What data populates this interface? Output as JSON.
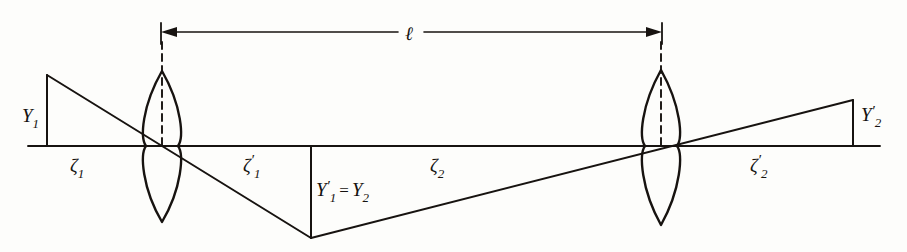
{
  "figure": {
    "background_color": "#fdfdfb",
    "ink_color": "#171310",
    "canvas": {
      "width": 907,
      "height": 252
    }
  },
  "labels": {
    "object_height": {
      "base": "Y",
      "sub": "1",
      "prime": ""
    },
    "intermediate_image": {
      "left_base": "Y",
      "left_sub": "1",
      "left_prime": "′",
      "equals": "=",
      "right_base": "Y",
      "right_sub": "2",
      "right_prime": ""
    },
    "final_image_height": {
      "base": "Y",
      "sub": "2",
      "prime": "′"
    },
    "object_distance_1": {
      "base": "ζ",
      "sub": "1",
      "prime": ""
    },
    "image_distance_1": {
      "base": "ζ",
      "sub": "1",
      "prime": "′"
    },
    "object_distance_2": {
      "base": "ζ",
      "sub": "2",
      "prime": ""
    },
    "image_distance_2": {
      "base": "ζ",
      "sub": "2",
      "prime": "′"
    },
    "lens_separation": {
      "base": "ℓ",
      "sub": "",
      "prime": ""
    }
  },
  "elements": {
    "optical_axis_label": "optical-axis",
    "lens_1_label": "lens-1",
    "lens_2_label": "lens-2",
    "dimension_label": "lens-separation-dimension"
  },
  "geometry": {
    "optical_axis": {
      "x1": 28,
      "y": 146,
      "x2": 880
    },
    "lens_1": {
      "cx": 162,
      "top_y": 71,
      "bottom_y": 222,
      "half_width": 16
    },
    "lens_2": {
      "cx": 661,
      "top_y": 70,
      "bottom_y": 225,
      "half_width": 16
    },
    "object": {
      "x": 47,
      "top_y": 75,
      "base_y": 146
    },
    "intermediate_image": {
      "x": 311,
      "y": 238,
      "base_y": 146
    },
    "final_image": {
      "x": 853,
      "top_y": 100,
      "base_y": 146
    },
    "dimension": {
      "y": 32,
      "x_left": 161,
      "x_right": 662,
      "gap_left": 398,
      "gap_right": 424
    },
    "dash_1": {
      "x": 162,
      "y1": 42,
      "y2": 146
    },
    "dash_2": {
      "x": 661,
      "y1": 42,
      "y2": 146
    }
  },
  "label_positions": {
    "Y1": {
      "x": 22,
      "y": 122
    },
    "Y1p_eq_Y2": {
      "x": 316,
      "y": 196
    },
    "Y2p": {
      "x": 861,
      "y": 121
    },
    "zeta1": {
      "x": 70,
      "y": 172
    },
    "zeta1p": {
      "x": 243,
      "y": 172
    },
    "zeta2": {
      "x": 430,
      "y": 172
    },
    "zeta2p": {
      "x": 750,
      "y": 172
    },
    "ell": {
      "x": 405,
      "y": 40
    }
  }
}
